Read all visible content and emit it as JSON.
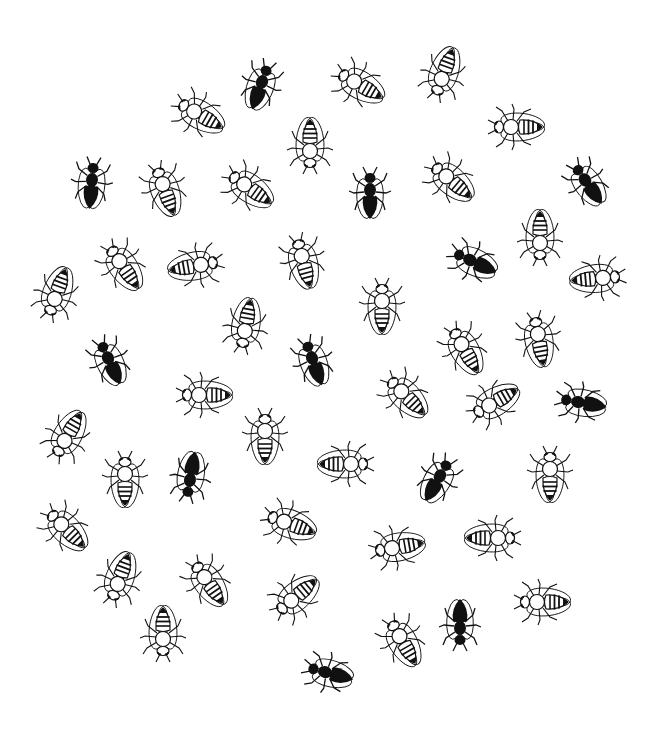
{
  "image": {
    "description": "Black-and-white illustration of bees and ants scattered in a roughly circular arrangement",
    "background": "#ffffff",
    "ink": "#111111"
  },
  "insects": [
    {
      "type": "dark",
      "x": 262,
      "y": 82,
      "rot": 20
    },
    {
      "type": "striped",
      "x": 355,
      "y": 82,
      "rot": -60
    },
    {
      "type": "striped",
      "x": 442,
      "y": 78,
      "rot": 200
    },
    {
      "type": "striped",
      "x": 195,
      "y": 112,
      "rot": -60
    },
    {
      "type": "striped",
      "x": 512,
      "y": 127,
      "rot": -90
    },
    {
      "type": "dark",
      "x": 92,
      "y": 180,
      "rot": 5
    },
    {
      "type": "striped",
      "x": 310,
      "y": 150,
      "rot": 180
    },
    {
      "type": "striped",
      "x": 163,
      "y": 185,
      "rot": -20
    },
    {
      "type": "striped",
      "x": 245,
      "y": 185,
      "rot": -55
    },
    {
      "type": "dark",
      "x": 370,
      "y": 190,
      "rot": 0
    },
    {
      "type": "striped",
      "x": 447,
      "y": 177,
      "rot": -50
    },
    {
      "type": "dark",
      "x": 585,
      "y": 180,
      "rot": -35
    },
    {
      "type": "striped",
      "x": 120,
      "y": 262,
      "rot": -35
    },
    {
      "type": "striped",
      "x": 200,
      "y": 265,
      "rot": 80
    },
    {
      "type": "striped",
      "x": 302,
      "y": 257,
      "rot": -15
    },
    {
      "type": "dark",
      "x": 470,
      "y": 260,
      "rot": -65
    },
    {
      "type": "striped",
      "x": 540,
      "y": 242,
      "rot": 180
    },
    {
      "type": "striped",
      "x": 602,
      "y": 278,
      "rot": 85
    },
    {
      "type": "striped",
      "x": 55,
      "y": 298,
      "rot": 200
    },
    {
      "type": "striped",
      "x": 382,
      "y": 302,
      "rot": 0
    },
    {
      "type": "striped",
      "x": 245,
      "y": 330,
      "rot": 190
    },
    {
      "type": "dark",
      "x": 108,
      "y": 358,
      "rot": -25
    },
    {
      "type": "dark",
      "x": 312,
      "y": 358,
      "rot": -20
    },
    {
      "type": "striped",
      "x": 462,
      "y": 345,
      "rot": -30
    },
    {
      "type": "striped",
      "x": 538,
      "y": 335,
      "rot": -10
    },
    {
      "type": "striped",
      "x": 200,
      "y": 395,
      "rot": -90
    },
    {
      "type": "striped",
      "x": 402,
      "y": 392,
      "rot": -45
    },
    {
      "type": "striped",
      "x": 490,
      "y": 405,
      "rot": 240
    },
    {
      "type": "dark",
      "x": 578,
      "y": 402,
      "rot": -80
    },
    {
      "type": "striped",
      "x": 65,
      "y": 440,
      "rot": 210
    },
    {
      "type": "striped",
      "x": 265,
      "y": 432,
      "rot": 0
    },
    {
      "type": "striped",
      "x": 125,
      "y": 475,
      "rot": 0
    },
    {
      "type": "dark",
      "x": 190,
      "y": 480,
      "rot": 190
    },
    {
      "type": "striped",
      "x": 350,
      "y": 464,
      "rot": 90
    },
    {
      "type": "dark",
      "x": 440,
      "y": 476,
      "rot": 30
    },
    {
      "type": "striped",
      "x": 550,
      "y": 470,
      "rot": 0
    },
    {
      "type": "striped",
      "x": 62,
      "y": 525,
      "rot": -45
    },
    {
      "type": "striped",
      "x": 285,
      "y": 522,
      "rot": -70
    },
    {
      "type": "striped",
      "x": 393,
      "y": 548,
      "rot": -100
    },
    {
      "type": "striped",
      "x": 497,
      "y": 538,
      "rot": 90
    },
    {
      "type": "striped",
      "x": 118,
      "y": 583,
      "rot": 200
    },
    {
      "type": "striped",
      "x": 205,
      "y": 578,
      "rot": -35
    },
    {
      "type": "striped",
      "x": 292,
      "y": 600,
      "rot": 230
    },
    {
      "type": "striped",
      "x": 538,
      "y": 602,
      "rot": -90
    },
    {
      "type": "dark",
      "x": 460,
      "y": 628,
      "rot": 180
    },
    {
      "type": "striped",
      "x": 163,
      "y": 638,
      "rot": 180
    },
    {
      "type": "striped",
      "x": 400,
      "y": 637,
      "rot": -30
    },
    {
      "type": "dark",
      "x": 325,
      "y": 672,
      "rot": -75
    }
  ]
}
